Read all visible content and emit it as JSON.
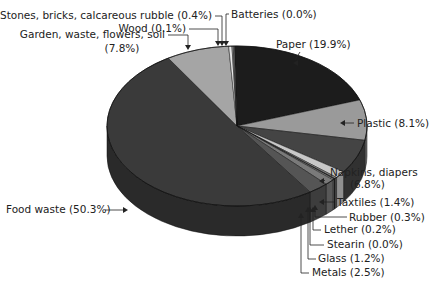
{
  "chart_data": {
    "type": "pie",
    "style": "3d",
    "title": "",
    "categories": [
      "Paper",
      "Plastic",
      "Napkins, diapers",
      "Taxtiles",
      "Rubber",
      "Lether",
      "Stearin",
      "Glass",
      "Metals",
      "Food waste",
      "Garden, waste, flowers, soil",
      "Stones, bricks, calcareous rubble",
      "Wood",
      "Batteries"
    ],
    "values": [
      19.9,
      8.1,
      6.8,
      1.4,
      0.3,
      0.2,
      0.0,
      1.2,
      2.5,
      50.3,
      7.8,
      0.4,
      0.1,
      0.0
    ],
    "unit": "%",
    "colors": [
      "#1c1c1c",
      "#9a9a9a",
      "#444444",
      "#c8c8c8",
      "#8a8a8a",
      "#2e2e2e",
      "#dddddd",
      "#7a7a7a",
      "#555555",
      "#3a3a3a",
      "#a5a5a5",
      "#e6e6e6",
      "#bdbdbd",
      "#777777"
    ],
    "labels": [
      {
        "text": "Paper (19.9%)",
        "lines": [
          "Paper (19.9%)"
        ]
      },
      {
        "text": "Plastic (8.1%)",
        "lines": [
          "Plastic (8.1%)"
        ]
      },
      {
        "text": "Napkins, diapers (6.8%)",
        "lines": [
          "Napkins, diapers",
          "(6.8%)"
        ]
      },
      {
        "text": "Taxtiles (1.4%)",
        "lines": [
          "Taxtiles (1.4%)"
        ]
      },
      {
        "text": "Rubber (0.3%)",
        "lines": [
          "Rubber (0.3%)"
        ]
      },
      {
        "text": "Lether (0.2%)",
        "lines": [
          "Lether (0.2%)"
        ]
      },
      {
        "text": "Stearin (0.0%)",
        "lines": [
          "Stearin (0.0%)"
        ]
      },
      {
        "text": "Glass (1.2%)",
        "lines": [
          "Glass (1.2%)"
        ]
      },
      {
        "text": "Metals (2.5%)",
        "lines": [
          "Metals (2.5%)"
        ]
      },
      {
        "text": "Food waste (50.3%)",
        "lines": [
          "Food waste (50.3%)"
        ]
      },
      {
        "text": "Garden, waste, flowers, soil (7.8%)",
        "lines": [
          "Garden, waste, flowers, soil",
          "(7.8%)"
        ]
      },
      {
        "text": "Stones, bricks, calcareous rubble (0.4%)",
        "lines": [
          "Stones, bricks, calcareous rubble (0.4%)"
        ]
      },
      {
        "text": "Wood (0.1%)",
        "lines": [
          "Wood (0.1%)"
        ]
      },
      {
        "text": "Batteries (0.0%)",
        "lines": [
          "Batteries (0.0%)"
        ]
      }
    ],
    "legend": "none (callout labels with arrows)",
    "grid": false
  }
}
